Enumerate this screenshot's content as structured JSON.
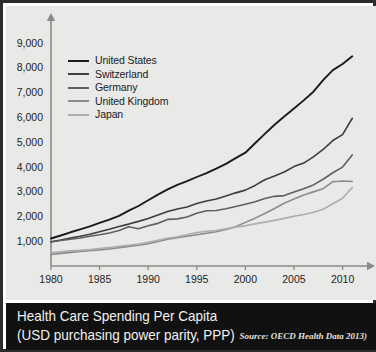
{
  "banner": {
    "title_line1": "Health Care Spending Per Capita",
    "title_line2": "(USD purchasing power parity, PPP)",
    "source": "Source: OECD Health Data 2013)"
  },
  "colors": {
    "panel_background": "#e9e9e7",
    "banner_background": "#111111",
    "banner_text": "#f2f2f0",
    "axis": "#8a8a88",
    "border": "#2b2b2b",
    "united_states": "#1a1a1a",
    "switzerland": "#3d3d3d",
    "germany": "#5f5f5f",
    "united_kingdom": "#8b8b8b",
    "japan": "#adadad"
  },
  "chart_data": {
    "type": "line",
    "title": "Health Care Spending Per Capita",
    "subtitle": "(USD purchasing power parity, PPP)",
    "xlabel": "",
    "ylabel": "",
    "xlim": [
      1980,
      2012
    ],
    "ylim": [
      0,
      9600
    ],
    "xticks": [
      1980,
      1985,
      1990,
      1995,
      2000,
      2005,
      2010
    ],
    "yticks": [
      1000,
      2000,
      3000,
      4000,
      5000,
      6000,
      7000,
      8000,
      9000
    ],
    "ytick_labels": [
      "1,000",
      "2,000",
      "3,000",
      "4,000",
      "5,000",
      "6,000",
      "7,000",
      "8,000",
      "9,000"
    ],
    "xtick_labels": [
      "1980",
      "1985",
      "1990",
      "1995",
      "2000",
      "2005",
      "2010"
    ],
    "grid": false,
    "legend_position": "upper left",
    "x": [
      1980,
      1981,
      1982,
      1983,
      1984,
      1985,
      1986,
      1987,
      1988,
      1989,
      1990,
      1991,
      1992,
      1993,
      1994,
      1995,
      1996,
      1997,
      1998,
      1999,
      2000,
      2001,
      2002,
      2003,
      2004,
      2005,
      2006,
      2007,
      2008,
      2009,
      2010,
      2011
    ],
    "series": [
      {
        "name": "United States",
        "color": "#1a1a1a",
        "values": [
          1110,
          1230,
          1360,
          1480,
          1600,
          1740,
          1870,
          2020,
          2230,
          2420,
          2650,
          2880,
          3090,
          3270,
          3420,
          3590,
          3750,
          3930,
          4120,
          4350,
          4570,
          4950,
          5330,
          5700,
          6030,
          6350,
          6680,
          7030,
          7500,
          7900,
          8150,
          8460
        ],
        "endpoint_value": 8460
      },
      {
        "name": "Switzerland",
        "color": "#3d3d3d",
        "values": [
          980,
          1050,
          1130,
          1200,
          1280,
          1380,
          1480,
          1590,
          1690,
          1800,
          1920,
          2060,
          2200,
          2300,
          2380,
          2520,
          2620,
          2700,
          2820,
          2950,
          3060,
          3250,
          3480,
          3630,
          3790,
          4010,
          4150,
          4400,
          4700,
          5060,
          5300,
          5960
        ],
        "endpoint_value": 5960
      },
      {
        "name": "Germany",
        "color": "#5f5f5f",
        "values": [
          970,
          1030,
          1080,
          1130,
          1200,
          1260,
          1330,
          1430,
          1580,
          1500,
          1620,
          1720,
          1880,
          1900,
          1980,
          2130,
          2230,
          2240,
          2310,
          2400,
          2490,
          2590,
          2720,
          2810,
          2840,
          2980,
          3120,
          3270,
          3500,
          3760,
          3990,
          4480
        ],
        "endpoint_value": 4480
      },
      {
        "name": "United Kingdom",
        "color": "#8b8b8b",
        "values": [
          470,
          510,
          550,
          590,
          620,
          650,
          690,
          740,
          790,
          840,
          900,
          990,
          1080,
          1140,
          1200,
          1260,
          1320,
          1380,
          1470,
          1580,
          1760,
          1930,
          2120,
          2320,
          2530,
          2700,
          2860,
          2990,
          3120,
          3400,
          3430,
          3410
        ],
        "endpoint_value": 3410
      },
      {
        "name": "Japan",
        "color": "#adadad",
        "values": [
          530,
          570,
          610,
          630,
          660,
          700,
          740,
          790,
          840,
          890,
          960,
          1040,
          1120,
          1180,
          1260,
          1350,
          1400,
          1430,
          1500,
          1570,
          1620,
          1700,
          1770,
          1840,
          1920,
          2010,
          2080,
          2170,
          2290,
          2510,
          2730,
          3170
        ],
        "endpoint_value": 3170
      }
    ],
    "legend": [
      {
        "label": "United States",
        "color": "#1a1a1a"
      },
      {
        "label": "Switzerland",
        "color": "#3d3d3d"
      },
      {
        "label": "Germany",
        "color": "#5f5f5f"
      },
      {
        "label": "United Kingdom",
        "color": "#8b8b8b"
      },
      {
        "label": "Japan",
        "color": "#adadad"
      }
    ]
  }
}
